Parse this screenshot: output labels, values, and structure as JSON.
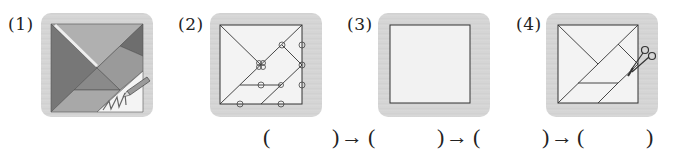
{
  "steps": [
    {
      "label": "(1)",
      "description": "colored tangram pieces with pencil tracing outline"
    },
    {
      "label": "(2)",
      "description": "tangram outline with circled points on lines"
    },
    {
      "label": "(3)",
      "description": "empty square"
    },
    {
      "label": "(4)",
      "description": "tangram outline being cut with scissors"
    }
  ],
  "answer_row": {
    "open_paren": "(",
    "close_paren": ")",
    "arrow": "→"
  },
  "colors": {
    "panel_bg": "#d6d6d6",
    "square_fill": "#f2f2f2",
    "line": "#333333",
    "piece_dark": "#7a7a7a",
    "piece_mid": "#9a9a9a",
    "piece_light": "#b5b5b5"
  }
}
